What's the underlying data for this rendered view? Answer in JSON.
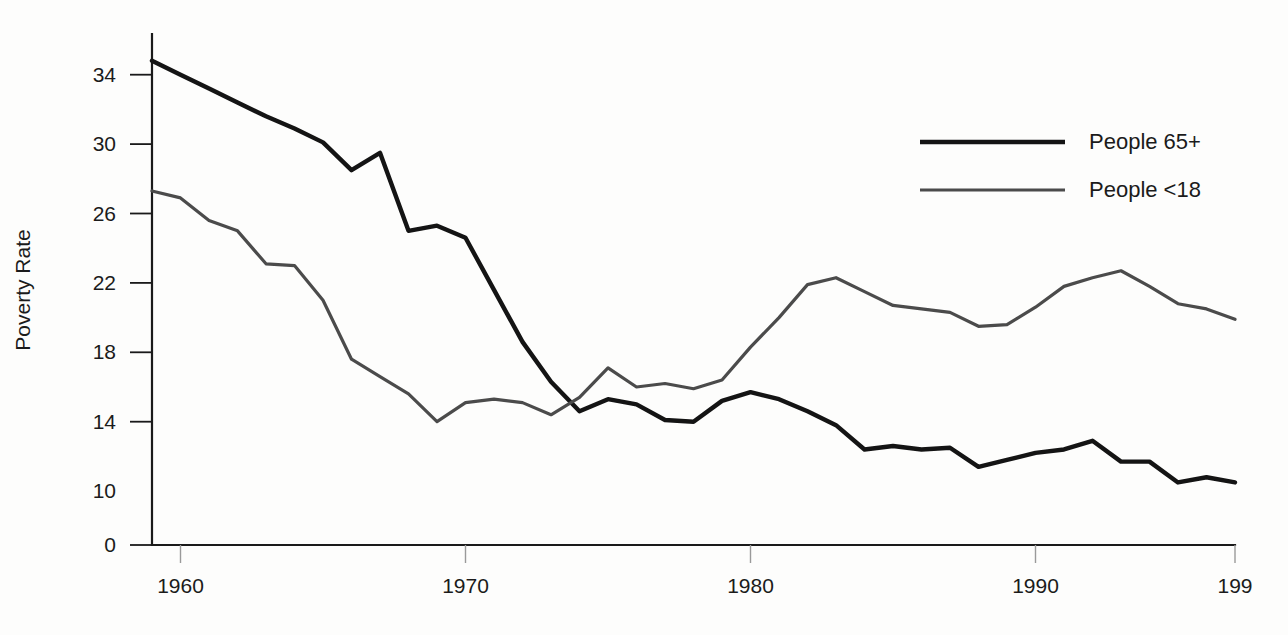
{
  "chart_data": {
    "type": "line",
    "title": "",
    "xlabel": "",
    "ylabel": "Poverty Rate",
    "x": [
      1959,
      1960,
      1961,
      1962,
      1963,
      1964,
      1965,
      1966,
      1967,
      1968,
      1969,
      1970,
      1971,
      1972,
      1973,
      1974,
      1975,
      1976,
      1977,
      1978,
      1979,
      1980,
      1981,
      1982,
      1983,
      1984,
      1985,
      1986,
      1987,
      1988,
      1989,
      1990,
      1991,
      1992,
      1993,
      1994,
      1995,
      1996,
      1997
    ],
    "xlim": [
      1959,
      1997
    ],
    "ylim": [
      0,
      36
    ],
    "y_ticks": [
      0,
      10,
      14,
      18,
      22,
      26,
      30,
      34
    ],
    "y_tick_labels": [
      "0",
      "10",
      "14",
      "18",
      "22",
      "26",
      "30",
      "34"
    ],
    "y_axis_note": "axis is broken between 0 and 10",
    "x_ticks": [
      1960,
      1970,
      1980,
      1990,
      1997
    ],
    "x_tick_labels": [
      "1960",
      "1970",
      "1980",
      "1990",
      "199"
    ],
    "grid": false,
    "legend_position": "top-right",
    "series": [
      {
        "name": "People 65+",
        "color": "#141414",
        "width": 4.4,
        "values": [
          34.8,
          34.0,
          33.2,
          32.4,
          31.6,
          30.9,
          30.1,
          28.5,
          29.5,
          25.0,
          25.3,
          24.6,
          21.6,
          18.6,
          16.3,
          14.6,
          15.3,
          15.0,
          14.1,
          14.0,
          15.2,
          15.7,
          15.3,
          14.6,
          13.8,
          12.4,
          12.6,
          12.4,
          12.5,
          11.4,
          11.8,
          12.2,
          12.4,
          12.9,
          11.7,
          11.7,
          10.5,
          10.8,
          10.5
        ]
      },
      {
        "name": "People <18",
        "color": "#4b4b4b",
        "width": 3.2,
        "values": [
          27.3,
          26.9,
          25.6,
          25.0,
          23.1,
          23.0,
          21.0,
          17.6,
          16.6,
          15.6,
          14.0,
          15.1,
          15.3,
          15.1,
          14.4,
          15.4,
          17.1,
          16.0,
          16.2,
          15.9,
          16.4,
          18.3,
          20.0,
          21.9,
          22.3,
          21.5,
          20.7,
          20.5,
          20.3,
          19.5,
          19.6,
          20.6,
          21.8,
          22.3,
          22.7,
          21.8,
          20.8,
          20.5,
          19.9
        ]
      }
    ]
  },
  "legend": {
    "items": [
      {
        "label": "People 65+"
      },
      {
        "label": "People <18"
      }
    ]
  },
  "axes": {
    "y_title": "Poverty Rate"
  }
}
